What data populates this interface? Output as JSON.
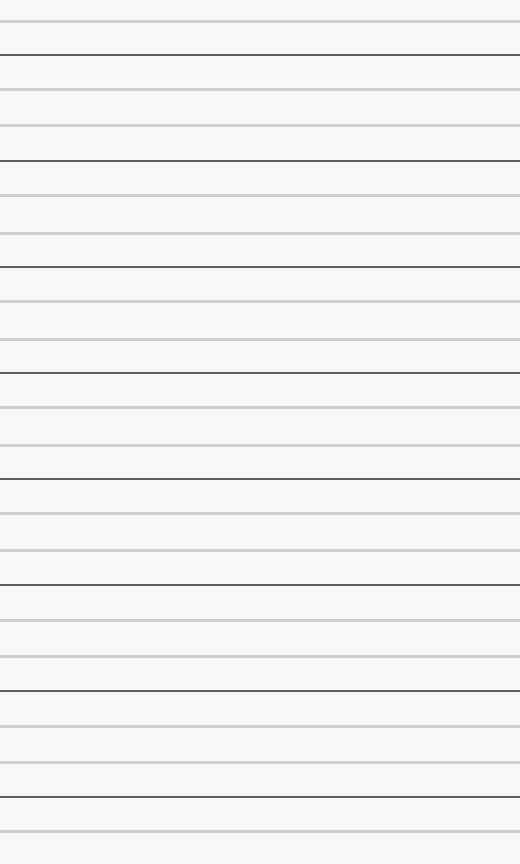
{
  "paper": {
    "background": "#f8f8f7",
    "light_color": "#cfcfcd",
    "dark_color": "#5f5f5d",
    "lines": [
      {
        "y": 20,
        "type": "light"
      },
      {
        "y": 54,
        "type": "dark"
      },
      {
        "y": 88,
        "type": "light"
      },
      {
        "y": 124,
        "type": "light"
      },
      {
        "y": 160,
        "type": "dark"
      },
      {
        "y": 194,
        "type": "light"
      },
      {
        "y": 232,
        "type": "light"
      },
      {
        "y": 266,
        "type": "dark"
      },
      {
        "y": 300,
        "type": "light"
      },
      {
        "y": 338,
        "type": "light"
      },
      {
        "y": 372,
        "type": "dark"
      },
      {
        "y": 406,
        "type": "light"
      },
      {
        "y": 444,
        "type": "light"
      },
      {
        "y": 478,
        "type": "dark"
      },
      {
        "y": 512,
        "type": "light"
      },
      {
        "y": 549,
        "type": "light"
      },
      {
        "y": 584,
        "type": "dark"
      },
      {
        "y": 619,
        "type": "light"
      },
      {
        "y": 655,
        "type": "light"
      },
      {
        "y": 690,
        "type": "dark"
      },
      {
        "y": 725,
        "type": "light"
      },
      {
        "y": 761,
        "type": "light"
      },
      {
        "y": 796,
        "type": "dark"
      },
      {
        "y": 830,
        "type": "light"
      }
    ]
  }
}
